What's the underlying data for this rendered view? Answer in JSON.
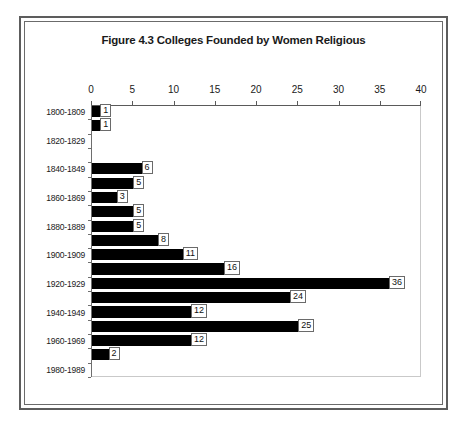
{
  "figure": {
    "title": "Figure 4.3  Colleges Founded by Women Religious",
    "frame_color": "#5d5d5d",
    "background": "#ffffff",
    "bar_color": "#000000",
    "axis_color": "#5a5a5a"
  },
  "chart_data": {
    "type": "bar",
    "orientation": "horizontal",
    "title": "Figure 4.3  Colleges Founded by Women Religious",
    "xlabel": "",
    "ylabel": "",
    "xlim": [
      0,
      40
    ],
    "xticks": [
      0,
      5,
      10,
      15,
      20,
      25,
      30,
      35,
      40
    ],
    "xtick_labels": [
      "0",
      "5",
      "10",
      "15",
      "20",
      "25",
      "30",
      "35",
      "40"
    ],
    "grid": false,
    "legend": false,
    "x_axis_position": "top",
    "categories": [
      "1800-1809",
      "1810-1819",
      "1820-1829",
      "1830-1839",
      "1840-1849",
      "1850-1859",
      "1860-1869",
      "1870-1879",
      "1880-1889",
      "1890-1899",
      "1900-1909",
      "1910-1919",
      "1920-1929",
      "1930-1939",
      "1940-1949",
      "1950-1959",
      "1960-1969",
      "1970-1979",
      "1980-1989"
    ],
    "visible_category_labels": [
      "1800-1809",
      "1820-1829",
      "1840-1849",
      "1860-1869",
      "1880-1889",
      "1900-1909",
      "1920-1929",
      "1940-1949",
      "1960-1969",
      "1980-1989"
    ],
    "values": [
      1,
      1,
      0,
      0,
      6,
      5,
      3,
      5,
      5,
      8,
      11,
      16,
      36,
      24,
      12,
      25,
      12,
      2,
      0
    ],
    "data_labels": [
      "1",
      "1",
      "",
      "",
      "6",
      "5",
      "3",
      "5",
      "5",
      "8",
      "11",
      "16",
      "36",
      "24",
      "12",
      "25",
      "12",
      "2",
      ""
    ]
  }
}
